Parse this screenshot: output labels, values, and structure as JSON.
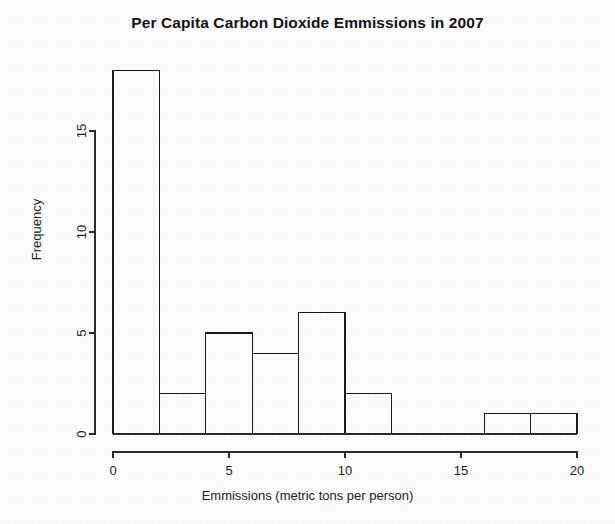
{
  "chart_data": {
    "type": "bar",
    "title": "Per Capita Carbon Dioxide Emmissions in 2007",
    "xlabel": "Emmissions (metric tons per person)",
    "ylabel": "Frequency",
    "bin_width": 2,
    "bin_edges": [
      0,
      2,
      4,
      6,
      8,
      10,
      12,
      14,
      16,
      18,
      20
    ],
    "categories": [
      "0-2",
      "2-4",
      "4-6",
      "6-8",
      "8-10",
      "10-12",
      "12-14",
      "14-16",
      "16-18",
      "18-20"
    ],
    "values": [
      18,
      2,
      5,
      4,
      6,
      2,
      0,
      0,
      1,
      1
    ],
    "xlim": [
      0,
      20
    ],
    "ylim": [
      0,
      18
    ],
    "xticks": [
      0,
      5,
      10,
      15,
      20
    ],
    "xticklabels": [
      "0",
      "5",
      "10",
      "15",
      "20"
    ],
    "yticks": [
      0,
      5,
      10,
      15
    ],
    "yticklabels": [
      "0",
      "5",
      "10",
      "15"
    ],
    "grid": false,
    "legend": false,
    "bar_fill": "#ffffff",
    "bar_stroke": "#1c1c1c",
    "axis_color": "#2a2a2a",
    "background": "#ffffff"
  }
}
